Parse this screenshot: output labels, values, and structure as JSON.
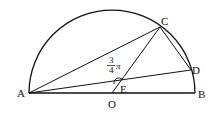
{
  "diagram": {
    "type": "geometry",
    "points": {
      "A": {
        "label": "A",
        "x": 29,
        "y": 93
      },
      "B": {
        "label": "B",
        "x": 195,
        "y": 93
      },
      "O": {
        "label": "O",
        "x": 112,
        "y": 93
      },
      "C": {
        "label": "C",
        "x": 160,
        "y": 27
      },
      "D": {
        "label": "D",
        "x": 191,
        "y": 70
      },
      "E": {
        "label": "E",
        "x": 119,
        "y": 83
      }
    },
    "angle_annotation": {
      "numerator": "3",
      "denominator": "4",
      "symbol": "π",
      "at": "E"
    },
    "colors": {
      "stroke": "#111111",
      "background": "#ffffff"
    }
  }
}
